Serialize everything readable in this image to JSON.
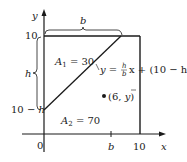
{
  "figure": {
    "type": "diagram",
    "axes": {
      "x_label": "x",
      "y_label": "y",
      "origin_label": "0",
      "x_ticks": [
        "b",
        "10"
      ],
      "y_ticks": [
        "10",
        "10 − h"
      ]
    },
    "braces": {
      "top": "b",
      "left": "h"
    },
    "regions": {
      "upper": {
        "name": "A",
        "sub": "1",
        "eq": " = 30"
      },
      "lower": {
        "name": "A",
        "sub": "2",
        "eq": " = 70"
      }
    },
    "line_equation": {
      "lhs": "y = ",
      "frac_num": "h",
      "frac_den": "b",
      "rhs": "x + (10 − h)"
    },
    "point": {
      "label_open": "(6, ",
      "label_var": "y",
      "label_close": ")"
    },
    "colors": {
      "ink": "#1a1a1a",
      "background": "#ffffff"
    }
  }
}
